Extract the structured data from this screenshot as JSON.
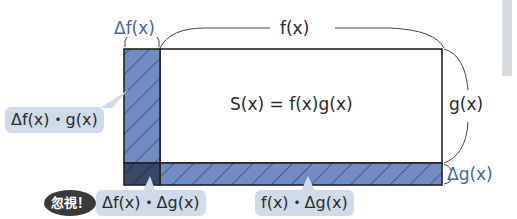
{
  "diagram": {
    "labels": {
      "delta_f": "Δf(x)",
      "f": "f(x)",
      "g": "g(x)",
      "delta_g": "Δg(x)",
      "area": "S(x) = f(x)g(x)"
    },
    "bubbles": {
      "left_strip": "Δf(x)・g(x)",
      "corner": "Δf(x)・Δg(x)",
      "bottom_strip": "f(x)・Δg(x)"
    },
    "badge": "忽視！",
    "colors": {
      "strip_fill": "#6f8cc4",
      "corner_fill": "#3b4766",
      "accent_text": "#4a62a8",
      "bubble_bg": "#cfdbe8",
      "badge_bg": "#3a3a3a"
    }
  }
}
